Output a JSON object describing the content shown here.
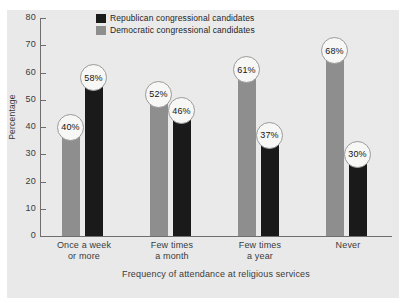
{
  "chart_data": {
    "type": "bar",
    "title": "",
    "subtitle": "",
    "xlabel": "Frequency of attendance at religious services",
    "ylabel": "Percentage",
    "ylim": [
      0,
      80
    ],
    "ytick_labels": [
      "80",
      "70",
      "60",
      "50",
      "40",
      "30",
      "20",
      "10",
      "0"
    ],
    "ytick_values": [
      80,
      70,
      60,
      50,
      40,
      30,
      20,
      10,
      0
    ],
    "grid": false,
    "legend_position": "top-center",
    "categories": [
      "Once a week or more",
      "Few times a month",
      "Few times a year",
      "Never"
    ],
    "category_lines": [
      [
        "Once a week",
        "or more"
      ],
      [
        "Few times",
        "a month"
      ],
      [
        "Few times",
        "a year"
      ],
      [
        "Never"
      ]
    ],
    "series": [
      {
        "name": "Democratic congressional candidates",
        "color": "#8e8e8e",
        "values": [
          40,
          52,
          61,
          68
        ],
        "labels": [
          "40%",
          "52%",
          "61%",
          "68%"
        ]
      },
      {
        "name": "Republican congressional candidates",
        "color": "#1a1a1a",
        "values": [
          58,
          46,
          37,
          30
        ],
        "labels": [
          "58%",
          "46%",
          "37%",
          "30%"
        ]
      }
    ]
  },
  "legend": {
    "items": [
      {
        "label": "Republican congressional candidates",
        "color": "#1a1a1a"
      },
      {
        "label": "Democratic congressional candidates",
        "color": "#8e8e8e"
      }
    ]
  },
  "colors": {
    "republican": "#1a1a1a",
    "democratic": "#8e8e8e",
    "panel_background": "#e9e9e9",
    "plot_background": "#eaeaea",
    "axis": "#6e6e6e",
    "text": "#3b3b3b",
    "badge_fill": "#f7f7f5",
    "badge_border": "#9a9a9a"
  }
}
